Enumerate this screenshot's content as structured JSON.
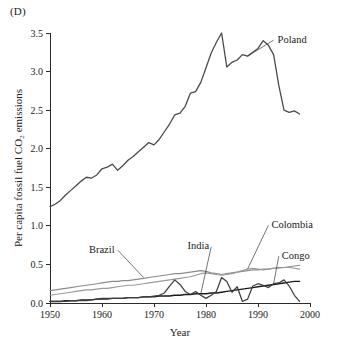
{
  "panel": {
    "label": "(D)"
  },
  "chart_data": {
    "type": "line",
    "title": "",
    "xlabel": "Year",
    "ylabel": "Per capita fossil fuel CO₂ emissions",
    "xlim": [
      1950,
      2000
    ],
    "ylim": [
      0.0,
      3.5
    ],
    "xticks": [
      "1950",
      "1960",
      "1970",
      "1980",
      "1990",
      "2000"
    ],
    "xtick_values": [
      1950,
      1960,
      1970,
      1980,
      1990,
      2000
    ],
    "yticks": [
      "0.0",
      "0.5",
      "1.0",
      "1.5",
      "2.0",
      "2.5",
      "3.0",
      "3.5"
    ],
    "ytick_values": [
      0.0,
      0.5,
      1.0,
      1.5,
      2.0,
      2.5,
      3.0,
      3.5
    ],
    "grid": false,
    "legend_position": "inline-labels",
    "x": [
      1950,
      1951,
      1952,
      1953,
      1954,
      1955,
      1956,
      1957,
      1958,
      1959,
      1960,
      1961,
      1962,
      1963,
      1964,
      1965,
      1966,
      1967,
      1968,
      1969,
      1970,
      1971,
      1972,
      1973,
      1974,
      1975,
      1976,
      1977,
      1978,
      1979,
      1980,
      1981,
      1982,
      1983,
      1984,
      1985,
      1986,
      1987,
      1988,
      1989,
      1990,
      1991,
      1992,
      1993,
      1994,
      1995,
      1996,
      1997,
      1998
    ],
    "series": [
      {
        "name": "Poland",
        "color": "#4a4a4a",
        "width": 1.3,
        "label_x": 1993,
        "label_y": 3.42,
        "values": [
          1.25,
          1.28,
          1.33,
          1.4,
          1.46,
          1.52,
          1.58,
          1.63,
          1.62,
          1.66,
          1.74,
          1.76,
          1.8,
          1.72,
          1.78,
          1.85,
          1.9,
          1.96,
          2.02,
          2.08,
          2.05,
          2.12,
          2.22,
          2.32,
          2.44,
          2.46,
          2.55,
          2.72,
          2.74,
          2.86,
          3.05,
          3.24,
          3.38,
          3.5,
          3.06,
          3.12,
          3.15,
          3.22,
          3.2,
          3.25,
          3.3,
          3.4,
          3.34,
          3.22,
          2.82,
          2.5,
          2.47,
          2.49,
          2.45
        ]
      },
      {
        "name": "Brazil",
        "color": "#8c8c8c",
        "width": 1.15,
        "label_x": 1963,
        "label_y": 0.7,
        "values": [
          0.16,
          0.17,
          0.18,
          0.19,
          0.2,
          0.21,
          0.22,
          0.23,
          0.24,
          0.25,
          0.26,
          0.27,
          0.28,
          0.28,
          0.29,
          0.29,
          0.3,
          0.31,
          0.32,
          0.33,
          0.34,
          0.35,
          0.36,
          0.37,
          0.38,
          0.38,
          0.39,
          0.4,
          0.41,
          0.42,
          0.41,
          0.39,
          0.38,
          0.37,
          0.38,
          0.39,
          0.4,
          0.41,
          0.42,
          0.43,
          0.43,
          0.44,
          0.44,
          0.45,
          0.46,
          0.46,
          0.47,
          0.48,
          0.49
        ]
      },
      {
        "name": "Colombia",
        "color": "#9a9a9a",
        "width": 1.15,
        "label_x": 1992,
        "label_y": 1.02,
        "values": [
          0.1,
          0.11,
          0.12,
          0.13,
          0.14,
          0.15,
          0.16,
          0.17,
          0.17,
          0.18,
          0.19,
          0.19,
          0.2,
          0.21,
          0.22,
          0.23,
          0.23,
          0.24,
          0.25,
          0.26,
          0.27,
          0.28,
          0.29,
          0.3,
          0.31,
          0.32,
          0.33,
          0.34,
          0.36,
          0.38,
          0.39,
          0.38,
          0.37,
          0.36,
          0.37,
          0.38,
          0.4,
          0.42,
          0.44,
          0.45,
          0.44,
          0.43,
          0.44,
          0.45,
          0.45,
          0.46,
          0.46,
          0.45,
          0.44
        ]
      },
      {
        "name": "India",
        "color": "#1a1a1a",
        "width": 1.4,
        "label_x": 1981,
        "label_y": 0.74,
        "values": [
          0.02,
          0.02,
          0.02,
          0.03,
          0.03,
          0.03,
          0.04,
          0.04,
          0.04,
          0.05,
          0.05,
          0.05,
          0.06,
          0.06,
          0.06,
          0.07,
          0.07,
          0.07,
          0.08,
          0.08,
          0.08,
          0.09,
          0.09,
          0.09,
          0.1,
          0.1,
          0.11,
          0.11,
          0.12,
          0.12,
          0.12,
          0.13,
          0.13,
          0.14,
          0.15,
          0.16,
          0.17,
          0.18,
          0.19,
          0.2,
          0.21,
          0.22,
          0.23,
          0.24,
          0.25,
          0.26,
          0.27,
          0.28,
          0.28
        ]
      },
      {
        "name": "Congo",
        "color": "#3d3d3d",
        "width": 1.25,
        "label_x": 1994,
        "label_y": 0.62,
        "values": [
          0.02,
          0.02,
          0.02,
          0.02,
          0.03,
          0.03,
          0.03,
          0.03,
          0.04,
          0.05,
          0.06,
          0.06,
          0.06,
          0.06,
          0.06,
          0.07,
          0.07,
          0.07,
          0.08,
          0.08,
          0.09,
          0.1,
          0.13,
          0.22,
          0.3,
          0.24,
          0.15,
          0.11,
          0.15,
          0.1,
          0.06,
          0.1,
          0.15,
          0.33,
          0.28,
          0.14,
          0.21,
          0.02,
          0.05,
          0.22,
          0.25,
          0.23,
          0.2,
          0.25,
          0.26,
          0.3,
          0.22,
          0.1,
          0.02
        ]
      }
    ]
  }
}
